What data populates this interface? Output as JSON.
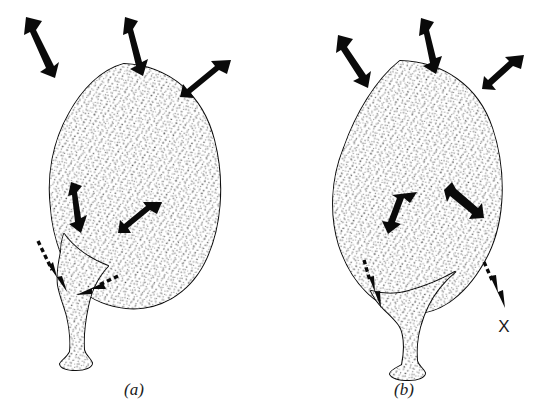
{
  "figure": {
    "background_color": "#ffffff",
    "ink_color": "#101010",
    "stipple_color": "#3a3a3a",
    "panels": [
      {
        "id": "panel-a",
        "caption": "(a)",
        "caption_x": 134,
        "caption_y": 395,
        "shape_label": "ovoid uterus with lateral cervix",
        "external_arrows": [
          {
            "name": "external-arrow-top-left",
            "style": "solid",
            "direction": "down-right"
          },
          {
            "name": "external-arrow-top-center",
            "style": "solid",
            "direction": "down"
          },
          {
            "name": "external-arrow-top-right",
            "style": "solid",
            "direction": "down-left"
          }
        ],
        "internal_arrows": [
          {
            "name": "internal-arrow-left",
            "style": "solid",
            "direction": "down"
          },
          {
            "name": "internal-arrow-right",
            "style": "solid",
            "direction": "down-left"
          }
        ],
        "dashed_arrows": [
          {
            "name": "dashed-arrow-left",
            "style": "dashed",
            "direction": "down"
          },
          {
            "name": "dashed-arrow-lower",
            "style": "dashed",
            "direction": "left"
          }
        ]
      },
      {
        "id": "panel-b",
        "caption": "(b)",
        "caption_x": 404,
        "caption_y": 395,
        "shape_label": "rounded uterus with central cervix",
        "external_arrows": [
          {
            "name": "external-arrow-top-left",
            "style": "solid",
            "direction": "down-right"
          },
          {
            "name": "external-arrow-top-center",
            "style": "solid",
            "direction": "down"
          },
          {
            "name": "external-arrow-top-right",
            "style": "solid",
            "direction": "down-left"
          }
        ],
        "internal_arrows": [
          {
            "name": "internal-arrow-left",
            "style": "solid",
            "direction": "down-left"
          },
          {
            "name": "internal-arrow-right",
            "style": "solid",
            "direction": "down-right"
          }
        ],
        "dashed_arrows": [
          {
            "name": "dashed-arrow-center",
            "style": "dashed",
            "direction": "down"
          },
          {
            "name": "dashed-arrow-right",
            "style": "dashed",
            "direction": "down-right"
          }
        ],
        "annotations": [
          {
            "name": "x-mark",
            "text": "X",
            "x": 504,
            "y": 332
          }
        ]
      }
    ]
  }
}
